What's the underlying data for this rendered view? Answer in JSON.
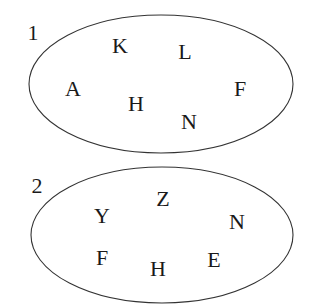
{
  "diagram": {
    "type": "set-diagram",
    "colors": {
      "stroke": "#333333",
      "text": "#1a1a1a",
      "background": "#ffffff"
    },
    "sets": [
      {
        "label": "1",
        "label_pos": [
          33,
          32
        ],
        "ellipse": {
          "cx": 161,
          "cy": 84,
          "rx": 132,
          "ry": 69
        },
        "elements": [
          {
            "text": "K",
            "x": 120,
            "y": 45
          },
          {
            "text": "L",
            "x": 185,
            "y": 51
          },
          {
            "text": "A",
            "x": 73,
            "y": 88
          },
          {
            "text": "H",
            "x": 136,
            "y": 103
          },
          {
            "text": "N",
            "x": 189,
            "y": 121
          },
          {
            "text": "F",
            "x": 240,
            "y": 88
          }
        ]
      },
      {
        "label": "2",
        "label_pos": [
          37,
          185
        ],
        "ellipse": {
          "cx": 162,
          "cy": 235,
          "rx": 131,
          "ry": 68
        },
        "elements": [
          {
            "text": "Z",
            "x": 163,
            "y": 198
          },
          {
            "text": "Y",
            "x": 102,
            "y": 215
          },
          {
            "text": "N",
            "x": 237,
            "y": 221
          },
          {
            "text": "F",
            "x": 102,
            "y": 257
          },
          {
            "text": "H",
            "x": 158,
            "y": 268
          },
          {
            "text": "E",
            "x": 214,
            "y": 259
          }
        ]
      }
    ]
  }
}
